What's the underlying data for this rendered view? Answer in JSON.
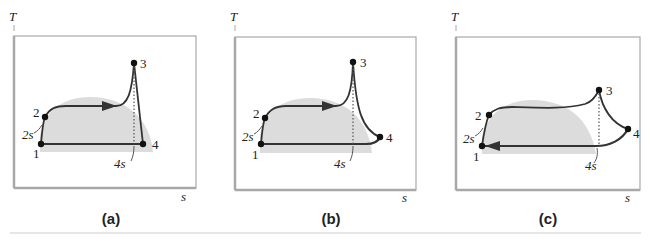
{
  "figure": {
    "panels": [
      {
        "id": "a",
        "caption": "(a)",
        "y_axis_label": "T",
        "x_axis_label": "s",
        "points": {
          "p1": "1",
          "p2": "2",
          "p3": "3",
          "p4": "4",
          "p2s": "2s",
          "p4s": "4s"
        }
      },
      {
        "id": "b",
        "caption": "(b)",
        "y_axis_label": "T",
        "x_axis_label": "s",
        "points": {
          "p1": "1",
          "p2": "2",
          "p3": "3",
          "p4": "4",
          "p2s": "2s",
          "p4s": "4s"
        }
      },
      {
        "id": "c",
        "caption": "(c)",
        "y_axis_label": "T",
        "x_axis_label": "s",
        "points": {
          "p1": "1",
          "p2": "2",
          "p3": "3",
          "p4": "4",
          "p2s": "2s",
          "p4s": "4s"
        }
      }
    ],
    "colors": {
      "dome": "#dcdcdc",
      "cycle_line": "#333333",
      "frame": "#a8a8a8"
    }
  }
}
